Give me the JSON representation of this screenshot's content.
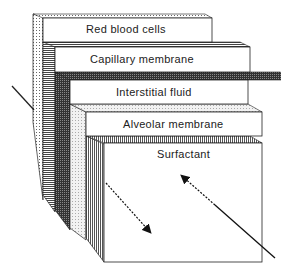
{
  "diagram": {
    "title": "",
    "layers": [
      {
        "label": "Red blood cells"
      },
      {
        "label": "Capillary membrane"
      },
      {
        "label": "Interstitial fluid"
      },
      {
        "label": "Alveolar membrane"
      },
      {
        "label": "Surfactant"
      }
    ],
    "arrows": [
      {
        "name": "incoming-left-arrow",
        "direction": "down-right"
      },
      {
        "name": "oxygen-diffusion-arrow",
        "direction": "down-right",
        "style": "dashed"
      },
      {
        "name": "co2-diffusion-arrow",
        "direction": "up-left",
        "style": "dashed"
      }
    ],
    "colors": {
      "line": "#222222",
      "face": "#ffffff",
      "hatch": "#555555"
    }
  }
}
